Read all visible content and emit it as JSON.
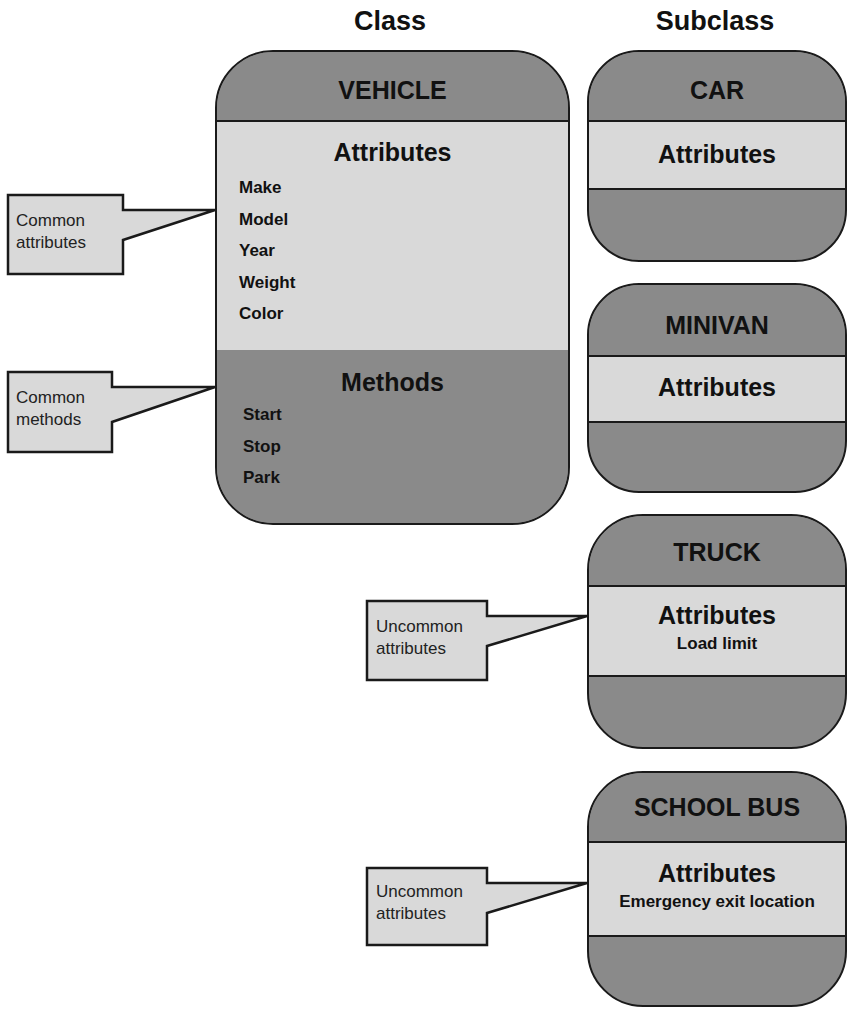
{
  "headings": {
    "class": "Class",
    "subclass": "Subclass"
  },
  "vehicle": {
    "title": "VEHICLE",
    "attributes_title": "Attributes",
    "attributes": [
      "Make",
      "Model",
      "Year",
      "Weight",
      "Color"
    ],
    "methods_title": "Methods",
    "methods": [
      "Start",
      "Stop",
      "Park"
    ]
  },
  "subclasses": [
    {
      "title": "CAR",
      "attributes_title": "Attributes",
      "attributes": []
    },
    {
      "title": "MINIVAN",
      "attributes_title": "Attributes",
      "attributes": []
    },
    {
      "title": "TRUCK",
      "attributes_title": "Attributes",
      "attributes": [
        "Load limit"
      ]
    },
    {
      "title": "SCHOOL BUS",
      "attributes_title": "Attributes",
      "attributes": [
        "Emergency exit location"
      ]
    }
  ],
  "callouts": [
    {
      "line1": "Common",
      "line2": "attributes"
    },
    {
      "line1": "Common",
      "line2": "methods"
    },
    {
      "line1": "Uncommon",
      "line2": "attributes"
    },
    {
      "line1": "Uncommon",
      "line2": "attributes"
    }
  ],
  "colors": {
    "dark_fill": "#8a8a8a",
    "light_fill": "#d9d9d9",
    "stroke": "#1a1a1a"
  }
}
